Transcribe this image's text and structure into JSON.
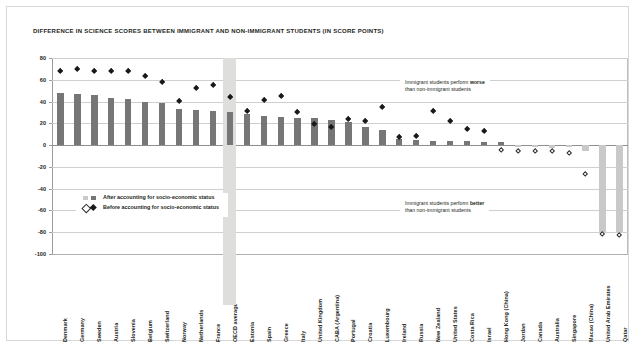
{
  "chart_data": {
    "type": "bar",
    "title": "DIFFERENCE IN SCIENCE SCORES BETWEEN IMMIGRANT AND NON-IMMIGRANT STUDENTS (IN SCORE POINTS)",
    "xlabel": "",
    "ylabel": "",
    "ylim": [
      -100,
      80
    ],
    "yticks": [
      80,
      60,
      40,
      20,
      0,
      -20,
      -40,
      -60,
      -80,
      -100
    ],
    "ytick_labels": [
      "80",
      "60",
      "40",
      "20",
      "0",
      "-20",
      "-40",
      "-60",
      "-80",
      "-100"
    ],
    "grid": true,
    "legend_position": "inside-lower-left",
    "highlight_category": "OECD average",
    "categories": [
      "Denmark",
      "Germany",
      "Sweden",
      "Austria",
      "Slovenia",
      "Belgium",
      "Switzerland",
      "Norway",
      "Netherlands",
      "France",
      "OECD average",
      "Estonia",
      "Spain",
      "Greece",
      "Italy",
      "United Kingdom",
      "CABA (Argentina)",
      "Portugal",
      "Croatia",
      "Luxembourg",
      "Ireland",
      "Russia",
      "New Zealand",
      "United States",
      "Costa Rica",
      "Israel",
      "Hong Kong (China)",
      "Jordan",
      "Canada",
      "Australia",
      "Singapore",
      "Macao (China)",
      "United Arab Emirates",
      "Qatar"
    ],
    "series": [
      {
        "name": "After accounting for socio-economic status",
        "key": "after",
        "marker": "bar",
        "values": [
          48,
          47,
          46,
          43,
          42,
          40,
          39,
          33,
          32,
          31,
          30,
          29,
          27,
          26,
          25,
          25,
          23,
          21,
          17,
          14,
          6,
          5,
          4,
          4,
          4,
          3,
          3,
          -2,
          -2,
          -3,
          -2,
          -5,
          -80,
          -80
        ]
      },
      {
        "name": "Before accounting for socio-economic status",
        "key": "before",
        "marker": "diamond",
        "values": [
          68,
          70,
          68,
          68,
          68,
          63,
          58,
          40,
          52,
          55,
          44,
          31,
          41,
          45,
          30,
          19,
          16,
          24,
          22,
          35,
          7,
          8,
          31,
          22,
          15,
          13,
          -5,
          -6,
          -6,
          -6,
          -7,
          -27,
          -82,
          -83
        ]
      }
    ],
    "series_fill_rule": {
      "positive": {
        "bar": "#767676",
        "diamond": "filled"
      },
      "negative": {
        "bar": "#c9c9c9",
        "diamond": "hollow"
      }
    },
    "annotations": [
      {
        "id": "worse",
        "line1_prefix": "Immigrant students perform ",
        "line1_bold": "worse",
        "line2": "than non-immigrant students"
      },
      {
        "id": "better",
        "line1_prefix": "Immigrant students perform ",
        "line1_bold": "better",
        "line2": "than non-immigrant students"
      }
    ]
  },
  "legend": {
    "items": [
      {
        "label": "After accounting for socio-economic status",
        "marker": "squares"
      },
      {
        "label": "Before accounting for socio-economic status",
        "marker": "diamonds"
      }
    ]
  }
}
